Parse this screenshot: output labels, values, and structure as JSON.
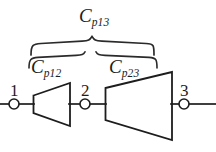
{
  "figure": {
    "type": "two-port-network-cascade-diagram",
    "background_color": "#ffffff",
    "line_color": "#1d1d1d",
    "labels": {
      "cp13": {
        "base": "C",
        "sub": "p13",
        "full": "Cp13"
      },
      "cp12": {
        "base": "C",
        "sub": "p12",
        "full": "Cp12"
      },
      "cp23": {
        "base": "C",
        "sub": "p23",
        "full": "Cp23"
      }
    },
    "nodes": [
      {
        "id": "node-1",
        "label": "1",
        "cx": 14,
        "cy": 104,
        "r": 5
      },
      {
        "id": "node-2",
        "label": "2",
        "cx": 85,
        "cy": 104,
        "r": 5
      },
      {
        "id": "node-3",
        "label": "3",
        "cx": 184,
        "cy": 104,
        "r": 5
      }
    ],
    "elements": [
      {
        "id": "trapezoid-cp12",
        "name": "Cp12",
        "left_x": 33,
        "left_top_y": 96,
        "left_bottom_y": 113,
        "right_x": 70,
        "right_top_y": 83,
        "right_bottom_y": 126
      },
      {
        "id": "trapezoid-cp23",
        "name": "Cp23",
        "left_x": 105,
        "left_top_y": 88,
        "left_bottom_y": 120,
        "right_x": 172,
        "right_top_y": 72,
        "right_bottom_y": 140
      }
    ],
    "braces": [
      {
        "id": "brace-cp13",
        "spans": "Cp13",
        "x_start": 30,
        "x_end": 155,
        "y": 40,
        "tip_x": 92
      },
      {
        "id": "brace-cp12",
        "spans": "Cp12",
        "x_start": 28,
        "x_end": 85,
        "y": 52
      },
      {
        "id": "brace-cp23",
        "spans": "Cp23",
        "x_start": 97,
        "x_end": 157,
        "y": 52
      }
    ],
    "wires": [
      {
        "id": "wire-in",
        "x1": 0,
        "x2": 9,
        "y": 104
      },
      {
        "id": "wire-1-to-a",
        "x1": 19,
        "x2": 33,
        "y": 104
      },
      {
        "id": "wire-a-to-2",
        "x1": 70,
        "x2": 80,
        "y": 104
      },
      {
        "id": "wire-2-to-b",
        "x1": 90,
        "x2": 105,
        "y": 104
      },
      {
        "id": "wire-b-to-3",
        "x1": 172,
        "x2": 179,
        "y": 104
      },
      {
        "id": "wire-out",
        "x1": 189,
        "x2": 216,
        "y": 104
      }
    ]
  }
}
